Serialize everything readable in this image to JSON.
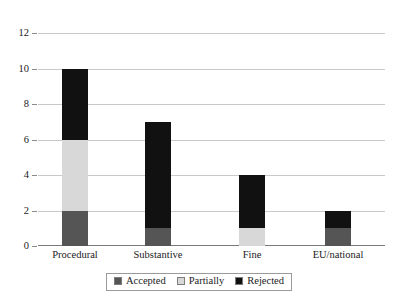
{
  "chart_data": {
    "type": "bar",
    "subtype": "stacked-bar",
    "title": "",
    "subtitle": "",
    "xlabel": "",
    "ylabel": "",
    "categories": [
      "Procedural",
      "Substantive",
      "Fine",
      "EU/national"
    ],
    "series": [
      {
        "name": "Accepted",
        "color": "#555555",
        "values": [
          2,
          1,
          0,
          1
        ]
      },
      {
        "name": "Partially",
        "color": "#d8d8d8",
        "values": [
          4,
          0,
          1,
          0
        ]
      },
      {
        "name": "Rejected",
        "color": "#111111",
        "values": [
          4,
          6,
          3,
          1
        ]
      }
    ],
    "totals": [
      10,
      7,
      4,
      2
    ],
    "ylim": [
      0,
      12
    ],
    "ytick_labels": [
      "0",
      "2",
      "4",
      "6",
      "8",
      "10",
      "12"
    ],
    "ytick_values": [
      0,
      2,
      4,
      6,
      8,
      10,
      12
    ],
    "grid": true,
    "grid_axis": "y",
    "legend": {
      "position": "bottom",
      "bordered": true,
      "entries": [
        {
          "label": "Accepted",
          "color": "#555555"
        },
        {
          "label": "Partially",
          "color": "#d8d8d8"
        },
        {
          "label": "Rejected",
          "color": "#111111"
        }
      ]
    },
    "colors": {
      "accepted": "#555555",
      "partially": "#d8d8d8",
      "rejected": "#111111",
      "gridline": "#c9c9c9",
      "axis": "#7a7a7a",
      "background": "#ffffff",
      "text": "#1a1a1a"
    }
  }
}
